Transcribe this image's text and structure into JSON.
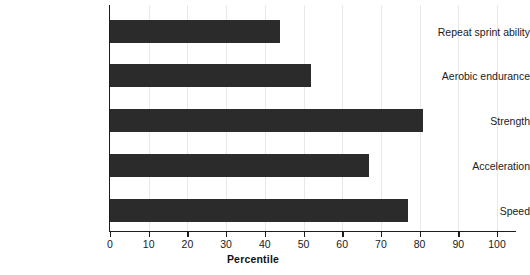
{
  "chart_data": {
    "type": "bar",
    "orientation": "horizontal",
    "title": "",
    "xlabel": "Percentile",
    "ylabel": "",
    "categories": [
      "Repeat sprint ability",
      "Aerobic endurance",
      "Strength",
      "Acceleration",
      "Speed"
    ],
    "values": [
      44,
      52,
      81,
      67,
      77
    ],
    "xlim": [
      0,
      100
    ],
    "xticks": [
      0,
      10,
      20,
      30,
      40,
      50,
      60,
      70,
      80,
      90,
      100
    ],
    "xtick_labels": [
      "0",
      "10",
      "20",
      "30",
      "40",
      "50",
      "60",
      "70",
      "80",
      "90",
      "100"
    ],
    "grid": "vertical",
    "legend": "none",
    "bar_color": "#2b2b2b",
    "background_color": "#ffffff",
    "gridline_color": "#e8e8e8",
    "axis_color": "#1d1d1d"
  }
}
